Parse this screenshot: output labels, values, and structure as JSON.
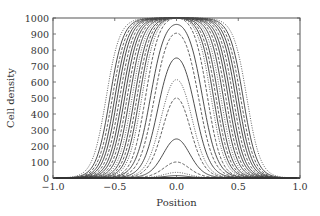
{
  "chart_data": {
    "type": "line",
    "title": "",
    "xlabel": "Position",
    "ylabel": "Cell density",
    "xlim": [
      -1.0,
      1.0
    ],
    "ylim": [
      0,
      1000
    ],
    "x_ticks": [
      -1.0,
      -0.5,
      0.0,
      0.5,
      1.0
    ],
    "x_tick_labels": [
      "−1.0",
      "−0.5",
      "0.0",
      "0.5",
      "1.0"
    ],
    "y_ticks": [
      0,
      100,
      200,
      300,
      400,
      500,
      600,
      700,
      800,
      900,
      1000
    ],
    "y_tick_labels": [
      "0",
      "100",
      "200",
      "300",
      "400",
      "500",
      "600",
      "700",
      "800",
      "900",
      "1000"
    ],
    "grid": false,
    "legend": null,
    "line_color": "#3a3a3a",
    "series": [
      {
        "name": "t1",
        "style": "solid",
        "peak": 15,
        "half_width": 0.06,
        "edge": 0.06
      },
      {
        "name": "t2",
        "style": "dotted",
        "peak": 35,
        "half_width": 0.07,
        "edge": 0.06
      },
      {
        "name": "t3",
        "style": "dashed",
        "peak": 100,
        "half_width": 0.08,
        "edge": 0.06
      },
      {
        "name": "t4",
        "style": "solid",
        "peak": 244,
        "half_width": 0.09,
        "edge": 0.06
      },
      {
        "name": "t5",
        "style": "dashed",
        "peak": 500,
        "half_width": 0.1,
        "edge": 0.06
      },
      {
        "name": "t6",
        "style": "dotted",
        "peak": 615,
        "half_width": 0.12,
        "edge": 0.06
      },
      {
        "name": "t7",
        "style": "solid",
        "peak": 750,
        "half_width": 0.15,
        "edge": 0.06
      },
      {
        "name": "t8",
        "style": "dashed",
        "peak": 905,
        "half_width": 0.18,
        "edge": 0.06
      },
      {
        "name": "t9",
        "style": "solid",
        "peak": 960,
        "half_width": 0.21,
        "edge": 0.06
      },
      {
        "name": "t10",
        "style": "dashed",
        "peak": 1000,
        "half_width": 0.25,
        "edge": 0.055
      },
      {
        "name": "t11",
        "style": "dotted",
        "peak": 1000,
        "half_width": 0.28,
        "edge": 0.055
      },
      {
        "name": "t12",
        "style": "solid",
        "peak": 1000,
        "half_width": 0.3,
        "edge": 0.055
      },
      {
        "name": "t13",
        "style": "dashed",
        "peak": 1000,
        "half_width": 0.32,
        "edge": 0.055
      },
      {
        "name": "t14",
        "style": "solid",
        "peak": 1000,
        "half_width": 0.34,
        "edge": 0.055
      },
      {
        "name": "t15",
        "style": "dotted",
        "peak": 1000,
        "half_width": 0.36,
        "edge": 0.055
      },
      {
        "name": "t16",
        "style": "solid",
        "peak": 1000,
        "half_width": 0.38,
        "edge": 0.055
      },
      {
        "name": "t17",
        "style": "dashed",
        "peak": 1000,
        "half_width": 0.4,
        "edge": 0.055
      },
      {
        "name": "t18",
        "style": "solid",
        "peak": 1000,
        "half_width": 0.42,
        "edge": 0.055
      },
      {
        "name": "t19",
        "style": "solid",
        "peak": 1000,
        "half_width": 0.44,
        "edge": 0.055
      },
      {
        "name": "t20",
        "style": "dashed",
        "peak": 1000,
        "half_width": 0.46,
        "edge": 0.055
      },
      {
        "name": "t21",
        "style": "solid",
        "peak": 1000,
        "half_width": 0.48,
        "edge": 0.055
      },
      {
        "name": "t22",
        "style": "solid",
        "peak": 1000,
        "half_width": 0.5,
        "edge": 0.055
      },
      {
        "name": "t23",
        "style": "dashed",
        "peak": 1000,
        "half_width": 0.52,
        "edge": 0.055
      },
      {
        "name": "t24",
        "style": "solid",
        "peak": 1000,
        "half_width": 0.54,
        "edge": 0.055
      },
      {
        "name": "t25",
        "style": "dotted",
        "peak": 1000,
        "half_width": 0.57,
        "edge": 0.055
      }
    ]
  },
  "layout": {
    "plot_left": 53,
    "plot_right": 300,
    "plot_top": 18,
    "plot_bottom": 178
  }
}
